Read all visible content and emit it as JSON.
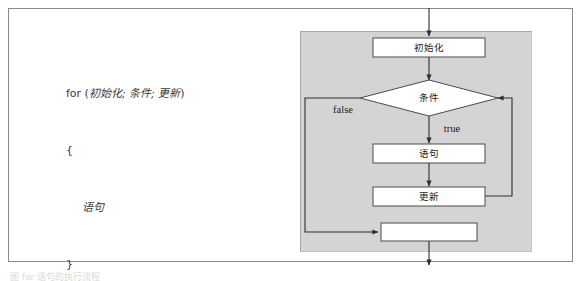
{
  "figure": {
    "caption": "图 for 语句的执行流程"
  },
  "code": {
    "lines": [
      {
        "indent": 0,
        "keyword": "for",
        "text": " (",
        "zh": "初始化; 条件; 更新",
        "tail": ")"
      },
      {
        "indent": 0,
        "keyword": "",
        "text": "{",
        "zh": "",
        "tail": ""
      },
      {
        "indent": 1,
        "keyword": "",
        "text": "",
        "zh": "语句",
        "tail": ""
      },
      {
        "indent": 0,
        "keyword": "",
        "text": "}",
        "zh": "",
        "tail": ""
      }
    ]
  },
  "flowchart": {
    "type": "flowchart",
    "panel_color": "#d4d4d4",
    "node_fill": "#ffffff",
    "node_stroke": "#4a4a4a",
    "nodes": [
      {
        "id": "init",
        "shape": "rect",
        "label": "初始化"
      },
      {
        "id": "condition",
        "shape": "diamond",
        "label": "条件"
      },
      {
        "id": "statement",
        "shape": "rect",
        "label": "语句"
      },
      {
        "id": "update",
        "shape": "rect",
        "label": "更新"
      },
      {
        "id": "exit",
        "shape": "rect",
        "label": ""
      }
    ],
    "edge_labels": {
      "false": "false",
      "true": "true"
    },
    "edges": [
      {
        "from": "entry",
        "to": "init",
        "label": ""
      },
      {
        "from": "init",
        "to": "condition",
        "label": ""
      },
      {
        "from": "condition",
        "to": "statement",
        "label": "true"
      },
      {
        "from": "condition",
        "to": "exit",
        "label": "false"
      },
      {
        "from": "statement",
        "to": "update",
        "label": ""
      },
      {
        "from": "update",
        "to": "condition",
        "label": ""
      },
      {
        "from": "exit",
        "to": "out",
        "label": ""
      }
    ]
  }
}
